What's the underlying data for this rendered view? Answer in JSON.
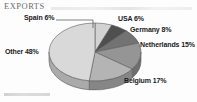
{
  "header": {
    "title": "EXPORTS",
    "rule_icon": "horizontal-rule"
  },
  "footer": {
    "note": ""
  },
  "chart_data": {
    "type": "pie",
    "title": "EXPORTS",
    "xlabel": "",
    "ylabel": "",
    "three_d": true,
    "legend_position": "none",
    "grid": false,
    "labels_show_percent": true,
    "categories": [
      "Spain",
      "USA",
      "Germany",
      "Netherlands",
      "Belgium",
      "Other"
    ],
    "values": [
      6,
      6,
      8,
      15,
      17,
      48
    ],
    "units": "percent",
    "slices": [
      {
        "name": "Spain",
        "value": 6,
        "label": "Spain 6%",
        "color": "#d2d2d2",
        "side_color": "#a8a8a8",
        "start_deg": 0,
        "sweep_deg": 21.6,
        "has_leader_line": true
      },
      {
        "name": "USA",
        "value": 6,
        "label": "USA 6%",
        "color": "#4f4f4f",
        "side_color": "#3a3a3a",
        "start_deg": 21.6,
        "sweep_deg": 21.6,
        "has_leader_line": false
      },
      {
        "name": "Germany",
        "value": 8,
        "label": "Germany 8%",
        "color": "#737373",
        "side_color": "#555555",
        "start_deg": 43.2,
        "sweep_deg": 28.8,
        "has_leader_line": false
      },
      {
        "name": "Netherlands",
        "value": 15,
        "label": "Netherlands 15%",
        "color": "#959595",
        "side_color": "#6e6e6e",
        "start_deg": 72.0,
        "sweep_deg": 54.0,
        "has_leader_line": false
      },
      {
        "name": "Belgium",
        "value": 17,
        "label": "Belgium 17%",
        "color": "#b4b4b4",
        "side_color": "#868686",
        "start_deg": 126.0,
        "sweep_deg": 61.2,
        "has_leader_line": false
      },
      {
        "name": "Other",
        "value": 48,
        "label": "Other 48%",
        "color": "#d9d9d9",
        "side_color": "#aaaaaa",
        "start_deg": 187.2,
        "sweep_deg": 172.8,
        "has_leader_line": false
      }
    ],
    "colors": {
      "background": "#fdfdfd",
      "outline": "#5a5a5a",
      "label_text": "#1a1a1a",
      "title_text": "#6b6b6b"
    }
  }
}
